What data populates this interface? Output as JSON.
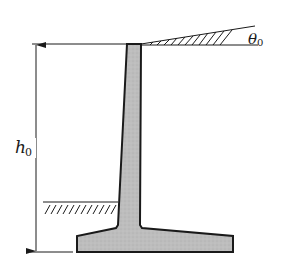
{
  "diagram": {
    "type": "cantilever retaining wall cross-section",
    "labels": {
      "height_symbol": "h",
      "height_subscript": "0",
      "angle_symbol": "θ",
      "angle_subscript": "0"
    },
    "colors": {
      "wall_fill": "#bdbdbd",
      "stroke": "#1a1a1a",
      "background": "#ffffff"
    },
    "elements": [
      "retaining-wall-stem",
      "retaining-wall-base-slab",
      "sloped-backfill-surface",
      "front-ground-surface",
      "height-dimension-arrow"
    ]
  }
}
